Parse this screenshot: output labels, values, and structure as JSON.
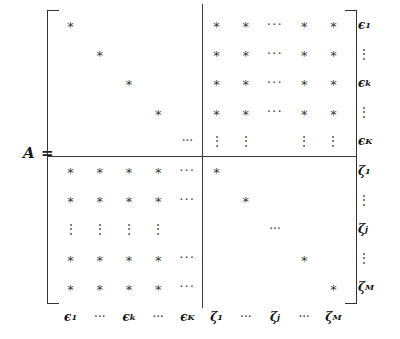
{
  "figure": {
    "lhs_label": "A =",
    "matrix_name": "A",
    "star_glyph": "*",
    "hdots_glyph": "···",
    "vdots_glyph": "⋮",
    "ddots_glyph": "···",
    "bracket_color": "#333333",
    "star_color": "#3a3a3a",
    "rule_color": "#3a3a3a",
    "label_color": "#111111",
    "background": "#ffffff"
  },
  "row_labels": [
    {
      "base": "ϵ",
      "sub": "1",
      "kind": "label"
    },
    {
      "base": "",
      "sub": "",
      "kind": "gap"
    },
    {
      "base": "⋮",
      "sub": "",
      "kind": "dots"
    },
    {
      "base": "",
      "sub": "",
      "kind": "gap"
    },
    {
      "base": "ϵ",
      "sub": "k",
      "kind": "label"
    },
    {
      "base": "",
      "sub": "",
      "kind": "gap"
    },
    {
      "base": "⋮",
      "sub": "",
      "kind": "dots"
    },
    {
      "base": "",
      "sub": "",
      "kind": "gap"
    },
    {
      "base": "",
      "sub": "",
      "kind": "gap"
    },
    {
      "base": "ϵ",
      "sub": "K",
      "kind": "label"
    }
  ],
  "row_labels_lower": [
    {
      "base": "ζ",
      "sub": "1",
      "kind": "label"
    },
    {
      "base": "",
      "sub": "",
      "kind": "gap"
    },
    {
      "base": "⋮",
      "sub": "",
      "kind": "dots"
    },
    {
      "base": "",
      "sub": "",
      "kind": "gap"
    },
    {
      "base": "ζ",
      "sub": "j",
      "kind": "label"
    },
    {
      "base": "",
      "sub": "",
      "kind": "gap"
    },
    {
      "base": "⋮",
      "sub": "",
      "kind": "dots"
    },
    {
      "base": "",
      "sub": "",
      "kind": "gap"
    },
    {
      "base": "",
      "sub": "",
      "kind": "gap"
    },
    {
      "base": "ζ",
      "sub": "M",
      "kind": "label"
    }
  ],
  "col_labels": [
    {
      "base": "ϵ",
      "sub": "1",
      "kind": "label"
    },
    {
      "base": "",
      "sub": "",
      "kind": "gap"
    },
    {
      "base": "···",
      "sub": "",
      "kind": "dots"
    },
    {
      "base": "",
      "sub": "",
      "kind": "gap"
    },
    {
      "base": "ϵ",
      "sub": "k",
      "kind": "label"
    },
    {
      "base": "···",
      "sub": "",
      "kind": "dots"
    },
    {
      "base": "ϵ",
      "sub": "K",
      "kind": "label"
    },
    {
      "base": "ζ",
      "sub": "1",
      "kind": "label"
    },
    {
      "base": "···",
      "sub": "",
      "kind": "dots"
    },
    {
      "base": "ζ",
      "sub": "j",
      "kind": "label"
    },
    {
      "base": "···",
      "sub": "",
      "kind": "dots"
    },
    {
      "base": "ζ",
      "sub": "M",
      "kind": "label"
    }
  ],
  "blocks": {
    "top_left": {
      "name": "epsilon-epsilon-block",
      "pattern": "diagonal",
      "description": "diagonal entries only"
    },
    "top_right": {
      "name": "epsilon-zeta-block",
      "pattern": "dense",
      "description": "all entries filled"
    },
    "bottom_left": {
      "name": "zeta-epsilon-block",
      "pattern": "dense",
      "description": "all entries filled"
    },
    "bottom_right": {
      "name": "zeta-zeta-block",
      "pattern": "diagonal",
      "description": "diagonal entries only"
    }
  },
  "grid": {
    "rows": 10,
    "cols": 10,
    "gap_rows": [
      4,
      7
    ],
    "gap_cols": [
      4,
      7
    ],
    "split_row": 5,
    "split_col": 5
  },
  "cells": [
    [
      "s",
      "",
      "",
      "",
      "",
      "",
      "",
      "",
      "",
      ""
    ],
    [
      "",
      "s",
      "",
      "",
      "",
      "",
      "",
      "",
      "",
      ""
    ],
    [
      "",
      "",
      "s",
      "",
      "",
      "",
      "",
      "",
      "",
      ""
    ],
    [
      "",
      "",
      "",
      "s",
      "",
      "",
      "",
      "",
      "",
      ""
    ],
    [
      "",
      "",
      "",
      "",
      "d",
      "",
      "",
      "",
      "",
      ""
    ],
    [
      "",
      "",
      "",
      "",
      "",
      "s",
      "",
      "",
      "",
      ""
    ],
    [
      "",
      "",
      "",
      "",
      "",
      "",
      "s",
      "",
      "",
      ""
    ],
    [
      "",
      "",
      "",
      "",
      "",
      "",
      "",
      "d",
      "",
      ""
    ],
    [
      "",
      "",
      "",
      "",
      "",
      "",
      "",
      "",
      "s",
      ""
    ],
    [
      "",
      "",
      "",
      "",
      "",
      "",
      "",
      "",
      "",
      "s"
    ]
  ]
}
